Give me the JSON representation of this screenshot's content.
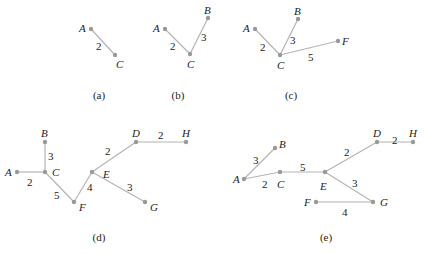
{
  "figure": {
    "colors": {
      "edge": "#b4b4b4",
      "node": "#999999",
      "text": "#222222",
      "background": "#ffffff"
    },
    "panels": [
      {
        "id": "a",
        "caption": "(a)",
        "caption_pos": [
          99,
          99
        ],
        "nodes": [
          {
            "name": "A",
            "x": 91,
            "y": 29,
            "lx": 79,
            "ly": 32
          },
          {
            "name": "C",
            "x": 115,
            "y": 55,
            "lx": 116,
            "ly": 68
          }
        ],
        "edges": [
          {
            "from": "A",
            "to": "C",
            "weight": "2",
            "lx": 96,
            "ly": 50
          }
        ]
      },
      {
        "id": "b",
        "caption": "(b)",
        "caption_pos": [
          178,
          99
        ],
        "nodes": [
          {
            "name": "A",
            "x": 165,
            "y": 29,
            "lx": 153,
            "ly": 32
          },
          {
            "name": "C",
            "x": 190,
            "y": 54,
            "lx": 187,
            "ly": 68
          },
          {
            "name": "B",
            "x": 208,
            "y": 18,
            "lx": 204,
            "ly": 14
          }
        ],
        "edges": [
          {
            "from": "A",
            "to": "C",
            "weight": "2",
            "lx": 170,
            "ly": 50
          },
          {
            "from": "C",
            "to": "B",
            "weight": "3",
            "lx": 201,
            "ly": 41
          }
        ]
      },
      {
        "id": "c",
        "caption": "(c)",
        "caption_pos": [
          291,
          99
        ],
        "nodes": [
          {
            "name": "A",
            "x": 255,
            "y": 29,
            "lx": 243,
            "ly": 32
          },
          {
            "name": "C",
            "x": 280,
            "y": 55,
            "lx": 277,
            "ly": 69
          },
          {
            "name": "B",
            "x": 298,
            "y": 19,
            "lx": 294,
            "ly": 15
          },
          {
            "name": "F",
            "x": 338,
            "y": 41,
            "lx": 342,
            "ly": 45
          }
        ],
        "edges": [
          {
            "from": "A",
            "to": "C",
            "weight": "2",
            "lx": 260,
            "ly": 51
          },
          {
            "from": "C",
            "to": "B",
            "weight": "3",
            "lx": 290,
            "ly": 44
          },
          {
            "from": "C",
            "to": "F",
            "weight": "5",
            "lx": 308,
            "ly": 61
          }
        ]
      },
      {
        "id": "d",
        "caption": "(d)",
        "caption_pos": [
          99,
          241
        ],
        "nodes": [
          {
            "name": "A",
            "x": 17,
            "y": 172,
            "lx": 5,
            "ly": 176
          },
          {
            "name": "C",
            "x": 45,
            "y": 172,
            "lx": 52,
            "ly": 176
          },
          {
            "name": "B",
            "x": 45,
            "y": 142,
            "lx": 41,
            "ly": 137
          },
          {
            "name": "F",
            "x": 74,
            "y": 202,
            "lx": 79,
            "ly": 211
          },
          {
            "name": "E",
            "x": 92,
            "y": 172,
            "lx": 103,
            "ly": 178
          },
          {
            "name": "D",
            "x": 136,
            "y": 142,
            "lx": 132,
            "ly": 137
          },
          {
            "name": "H",
            "x": 186,
            "y": 142,
            "lx": 182,
            "ly": 137
          },
          {
            "name": "G",
            "x": 145,
            "y": 202,
            "lx": 150,
            "ly": 211
          }
        ],
        "edges": [
          {
            "from": "A",
            "to": "C",
            "weight": "2",
            "lx": 27,
            "ly": 186
          },
          {
            "from": "C",
            "to": "B",
            "weight": "3",
            "lx": 48,
            "ly": 160
          },
          {
            "from": "C",
            "to": "F",
            "weight": "5",
            "lx": 54,
            "ly": 199
          },
          {
            "from": "F",
            "to": "E",
            "weight": "4",
            "lx": 87,
            "ly": 191
          },
          {
            "from": "E",
            "to": "D",
            "weight": "2",
            "lx": 105,
            "ly": 155
          },
          {
            "from": "D",
            "to": "H",
            "weight": "2",
            "lx": 158,
            "ly": 139
          },
          {
            "from": "E",
            "to": "G",
            "weight": "3",
            "lx": 127,
            "ly": 191
          }
        ]
      },
      {
        "id": "e",
        "caption": "(e)",
        "caption_pos": [
          326,
          241
        ],
        "nodes": [
          {
            "name": "A",
            "x": 244,
            "y": 179,
            "lx": 233,
            "ly": 183
          },
          {
            "name": "B",
            "x": 275,
            "y": 148,
            "lx": 279,
            "ly": 148
          },
          {
            "name": "C",
            "x": 280,
            "y": 172,
            "lx": 277,
            "ly": 188
          },
          {
            "name": "E",
            "x": 325,
            "y": 172,
            "lx": 320,
            "ly": 190
          },
          {
            "name": "D",
            "x": 377,
            "y": 142,
            "lx": 373,
            "ly": 137
          },
          {
            "name": "H",
            "x": 413,
            "y": 142,
            "lx": 409,
            "ly": 137
          },
          {
            "name": "G",
            "x": 373,
            "y": 202,
            "lx": 380,
            "ly": 206
          },
          {
            "name": "F",
            "x": 316,
            "y": 202,
            "lx": 304,
            "ly": 206
          }
        ],
        "edges": [
          {
            "from": "A",
            "to": "B",
            "weight": "3",
            "lx": 253,
            "ly": 164
          },
          {
            "from": "A",
            "to": "C",
            "weight": "2",
            "lx": 262,
            "ly": 188
          },
          {
            "from": "C",
            "to": "E",
            "weight": "5",
            "lx": 300,
            "ly": 171
          },
          {
            "from": "E",
            "to": "D",
            "weight": "2",
            "lx": 344,
            "ly": 156
          },
          {
            "from": "D",
            "to": "H",
            "weight": "2",
            "lx": 392,
            "ly": 144
          },
          {
            "from": "E",
            "to": "G",
            "weight": "3",
            "lx": 352,
            "ly": 187
          },
          {
            "from": "F",
            "to": "G",
            "weight": "4",
            "lx": 342,
            "ly": 216
          }
        ]
      }
    ]
  }
}
